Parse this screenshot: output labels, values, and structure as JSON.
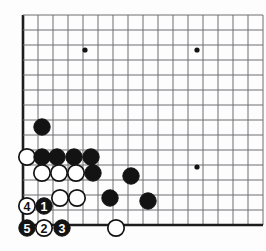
{
  "board": {
    "title": "Go board corner diagram",
    "kind": "go-game-diagram",
    "geometry": {
      "origin_x": 23,
      "origin_y": 15,
      "spacing": 15,
      "cols": 17,
      "rows": 15,
      "stone_radius": 8.2,
      "edge_left": true,
      "edge_bottom": true,
      "edge_top": false,
      "edge_right": false
    },
    "colors": {
      "background": "#fdfdfd",
      "line": "#6e6e72",
      "edge_line": "#1d1d1f",
      "black_stone": "#131313",
      "white_stone": "#ffffff",
      "white_stone_border": "#131313",
      "black_label_text": "#ffffff",
      "white_label_text": "#131313",
      "star_point": "#131313"
    },
    "star_points": [
      {
        "name": "star-point-upper-left",
        "cx": 85,
        "cy": 50
      },
      {
        "name": "star-point-upper-right",
        "cx": 197,
        "cy": 50
      },
      {
        "name": "star-point-lower-right",
        "cx": 197,
        "cy": 167
      }
    ],
    "stones": [
      {
        "id": "black-d10",
        "color": "black",
        "cx": 42,
        "cy": 127,
        "label": ""
      },
      {
        "id": "white-a7",
        "color": "white",
        "cx": 27,
        "cy": 157,
        "label": ""
      },
      {
        "id": "black-b7",
        "color": "black",
        "cx": 42,
        "cy": 157,
        "label": ""
      },
      {
        "id": "black-c7",
        "color": "black",
        "cx": 57,
        "cy": 157,
        "label": ""
      },
      {
        "id": "black-d7",
        "color": "black",
        "cx": 74,
        "cy": 157,
        "label": ""
      },
      {
        "id": "black-e7",
        "color": "black",
        "cx": 91,
        "cy": 157,
        "label": ""
      },
      {
        "id": "white-b6",
        "color": "white",
        "cx": 42,
        "cy": 173,
        "label": ""
      },
      {
        "id": "white-c6",
        "color": "white",
        "cx": 59,
        "cy": 173,
        "label": ""
      },
      {
        "id": "white-d6",
        "color": "white",
        "cx": 76,
        "cy": 173,
        "label": ""
      },
      {
        "id": "black-e6",
        "color": "black",
        "cx": 93,
        "cy": 173,
        "label": ""
      },
      {
        "id": "black-g6",
        "color": "black",
        "cx": 131,
        "cy": 176,
        "label": ""
      },
      {
        "id": "white-b5",
        "color": "white",
        "cx": 60,
        "cy": 198,
        "label": ""
      },
      {
        "id": "white-c5",
        "color": "white",
        "cx": 77,
        "cy": 198,
        "label": ""
      },
      {
        "id": "black-e5",
        "color": "black",
        "cx": 110,
        "cy": 198,
        "label": ""
      },
      {
        "id": "black-h5",
        "color": "black",
        "cx": 148,
        "cy": 201,
        "label": ""
      },
      {
        "id": "white-move-4",
        "color": "white",
        "cx": 27,
        "cy": 206,
        "label": "4"
      },
      {
        "id": "black-move-1",
        "color": "black",
        "cx": 44,
        "cy": 206,
        "label": "1"
      },
      {
        "id": "black-move-5",
        "color": "black",
        "cx": 27,
        "cy": 228,
        "label": "5"
      },
      {
        "id": "white-move-2",
        "color": "white",
        "cx": 44,
        "cy": 228,
        "label": "2"
      },
      {
        "id": "black-move-3",
        "color": "black",
        "cx": 62,
        "cy": 228,
        "label": "3"
      },
      {
        "id": "white-f1",
        "color": "white",
        "cx": 116,
        "cy": 228,
        "label": ""
      }
    ],
    "move_sequence": [
      {
        "move": "1",
        "color": "black"
      },
      {
        "move": "2",
        "color": "white"
      },
      {
        "move": "3",
        "color": "black"
      },
      {
        "move": "4",
        "color": "white"
      },
      {
        "move": "5",
        "color": "black"
      }
    ]
  }
}
